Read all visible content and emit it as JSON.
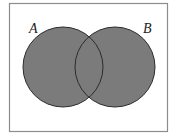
{
  "diagram": {
    "type": "venn",
    "frame": {
      "x": 9.5,
      "y": 3.5,
      "width": 158,
      "height": 128,
      "stroke": "#8c8c8c"
    },
    "fill_color": "#7b7b7b",
    "outline_color": "#2b2b2b",
    "sets": [
      {
        "id": "A",
        "label": "A",
        "cx": 63,
        "cy": 67,
        "r": 40,
        "label_x": 29,
        "label_y": 33
      },
      {
        "id": "B",
        "label": "B",
        "cx": 115,
        "cy": 67,
        "r": 40,
        "label_x": 143,
        "label_y": 33
      }
    ],
    "shaded_region": "A ∪ B"
  }
}
